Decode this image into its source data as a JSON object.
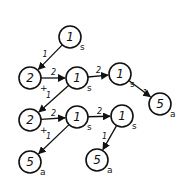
{
  "diagram": {
    "nodes": [
      {
        "id": "n1",
        "value": "1",
        "sub": "s",
        "x": 70,
        "y": 37
      },
      {
        "id": "n2",
        "value": "2",
        "sub": "+",
        "x": 30,
        "y": 78
      },
      {
        "id": "n3",
        "value": "1",
        "sub": "s",
        "x": 77,
        "y": 78
      },
      {
        "id": "n4",
        "value": "1",
        "sub": "s",
        "x": 120,
        "y": 74
      },
      {
        "id": "n5",
        "value": "5",
        "sub": "a",
        "x": 160,
        "y": 104
      },
      {
        "id": "n6",
        "value": "2",
        "sub": "+",
        "x": 30,
        "y": 120
      },
      {
        "id": "n7",
        "value": "1",
        "sub": "s",
        "x": 77,
        "y": 117
      },
      {
        "id": "n8",
        "value": "1",
        "sub": "s",
        "x": 122,
        "y": 116
      },
      {
        "id": "n9",
        "value": "5",
        "sub": "a",
        "x": 30,
        "y": 162
      },
      {
        "id": "n10",
        "value": "5",
        "sub": "a",
        "x": 97,
        "y": 160
      }
    ],
    "edges": [
      {
        "from": "n1",
        "to": "n2",
        "label": "1"
      },
      {
        "from": "n2",
        "to": "n3",
        "label": "2"
      },
      {
        "from": "n3",
        "to": "n4",
        "label": "2"
      },
      {
        "from": "n4",
        "to": "n5",
        "label": "1"
      },
      {
        "from": "n3",
        "to": "n6",
        "label": "1"
      },
      {
        "from": "n6",
        "to": "n7",
        "label": "2"
      },
      {
        "from": "n7",
        "to": "n8",
        "label": "2"
      },
      {
        "from": "n7",
        "to": "n9",
        "label": "1"
      },
      {
        "from": "n8",
        "to": "n10",
        "label": "1"
      }
    ]
  }
}
